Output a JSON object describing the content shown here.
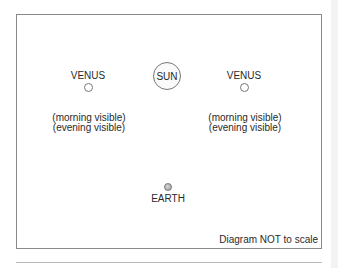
{
  "diagram": {
    "sun": {
      "label": "SUN"
    },
    "venus_left": {
      "label": "VENUS",
      "visibility": [
        "(morning visible)",
        "(evening visible)"
      ]
    },
    "venus_right": {
      "label": "VENUS",
      "visibility": [
        "(morning visible)",
        "(evening visible)"
      ]
    },
    "earth": {
      "label": "EARTH"
    },
    "note": "Diagram NOT to scale",
    "colors": {
      "frame": "#8a8a8a",
      "text": "#2a2a2a",
      "earth": "#a8a8a8"
    }
  }
}
